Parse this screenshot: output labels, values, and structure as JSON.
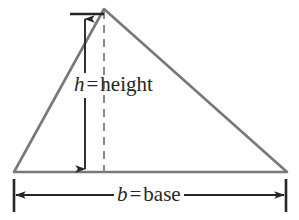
{
  "figure": {
    "kind": "geometry-diagram",
    "background_color": "#ffffff",
    "shape_stroke_color": "#787878",
    "annotation_color": "#262626",
    "dashed_line_color": "#8a8a8a",
    "triangle": {
      "apex": {
        "x": 104,
        "y": 9
      },
      "left_base": {
        "x": 14,
        "y": 172
      },
      "right_base": {
        "x": 287,
        "y": 172
      }
    },
    "altitude_dashed_line": {
      "from": {
        "x": 104,
        "y": 9
      },
      "to": {
        "x": 104,
        "y": 172
      },
      "dash": "8 6"
    },
    "height_dimension": {
      "x": 85,
      "top_y": 18,
      "bottom_y": 171,
      "top_tick": {
        "x1": 70,
        "x2": 104,
        "y": 14
      },
      "arrowheads": "both"
    },
    "base_dimension": {
      "y": 195,
      "left_x": 14,
      "right_x": 286,
      "left_tick": {
        "x": 14,
        "y1": 179,
        "y2": 212
      },
      "right_tick": {
        "x": 286,
        "y1": 179,
        "y2": 212
      },
      "arrowheads": "both"
    },
    "labels": {
      "height": {
        "variable": "h",
        "operator": "=",
        "word": "height",
        "full_text": "h = height"
      },
      "base": {
        "variable": "b",
        "operator": "=",
        "word": "base",
        "full_text": "b = base"
      }
    }
  }
}
